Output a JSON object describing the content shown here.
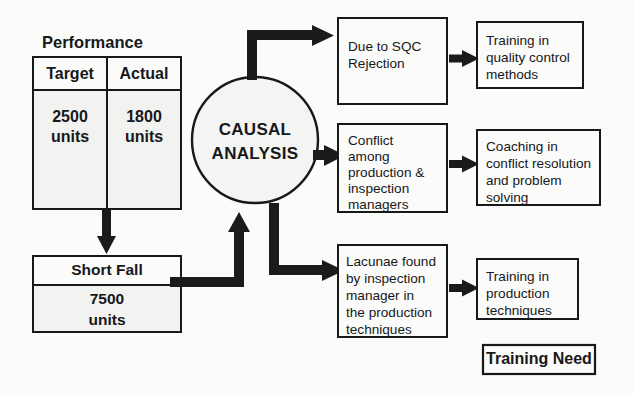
{
  "diagram": {
    "title_text": "Performance",
    "performance_table": {
      "columns": [
        "Target",
        "Actual"
      ],
      "values": [
        {
          "amount": "2500",
          "unit": "units"
        },
        {
          "amount": "1800",
          "unit": "units"
        }
      ]
    },
    "shortfall": {
      "label": "Short Fall",
      "amount": "7500",
      "unit": "units"
    },
    "hub": {
      "line1": "CAUSAL",
      "line2": "ANALYSIS"
    },
    "causes": [
      {
        "id": "cause-sqc",
        "lines": [
          "Due to SQC",
          "Rejection"
        ]
      },
      {
        "id": "cause-conflict",
        "lines": [
          "Conflict",
          "among",
          "production &",
          "inspection",
          "managers"
        ]
      },
      {
        "id": "cause-lacunae",
        "lines": [
          "Lacunae found",
          "by inspection",
          "manager in",
          "the production",
          "techniques"
        ]
      }
    ],
    "trainings": [
      {
        "id": "training-quality-control",
        "lines": [
          "Training in",
          "quality control",
          "methods"
        ]
      },
      {
        "id": "training-coaching",
        "lines": [
          "Coaching in",
          "conflict resolution",
          "and problem",
          "solving"
        ]
      },
      {
        "id": "training-production",
        "lines": [
          "Training in",
          "production",
          "techniques"
        ]
      }
    ],
    "legend": {
      "label": "Training Need"
    },
    "colors": {
      "ink": "#17181a",
      "arrow": "#1a1b1d",
      "background": "#fbfbfa",
      "table_fill": "#f2f2f1"
    }
  }
}
